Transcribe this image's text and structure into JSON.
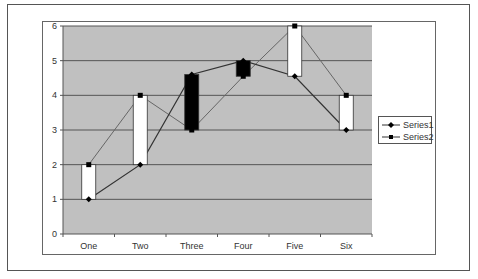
{
  "chart_data": {
    "type": "line",
    "subtype": "line with up/down bars (high-low)",
    "title": "",
    "xlabel": "",
    "ylabel": "",
    "categories": [
      "One",
      "Two",
      "Three",
      "Four",
      "Five",
      "Six"
    ],
    "series": [
      {
        "name": "Series1",
        "marker": "diamond",
        "values": [
          1,
          2,
          4.6,
          5,
          4.55,
          3
        ]
      },
      {
        "name": "Series2",
        "marker": "square",
        "values": [
          2,
          4,
          3,
          4.55,
          6,
          4
        ]
      }
    ],
    "up_down_bars": {
      "up_color": "#ffffff",
      "down_color": "#000000"
    },
    "ylim": [
      0,
      6
    ],
    "yticks": [
      0,
      1,
      2,
      3,
      4,
      5,
      6
    ],
    "grid": true,
    "plot_background": "#c0c0c0",
    "legend_position": "right"
  },
  "legend": {
    "items": [
      {
        "label": "Series1"
      },
      {
        "label": "Series2"
      }
    ]
  }
}
